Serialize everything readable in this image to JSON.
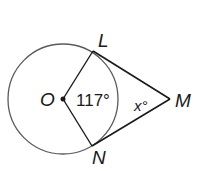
{
  "diagram": {
    "type": "geometry",
    "points": {
      "O": {
        "label": "O"
      },
      "L": {
        "label": "L"
      },
      "M": {
        "label": "M"
      },
      "N": {
        "label": "N"
      }
    },
    "angles": {
      "central": {
        "vertex": "O",
        "value": "117°"
      },
      "external": {
        "vertex": "M",
        "value": "x°"
      }
    },
    "segments": [
      "OL",
      "ON",
      "LM",
      "NM"
    ],
    "colors": {
      "circle": "#5a5a5a",
      "lines": "#1a1a1a",
      "text": "#1a1a1a"
    }
  }
}
